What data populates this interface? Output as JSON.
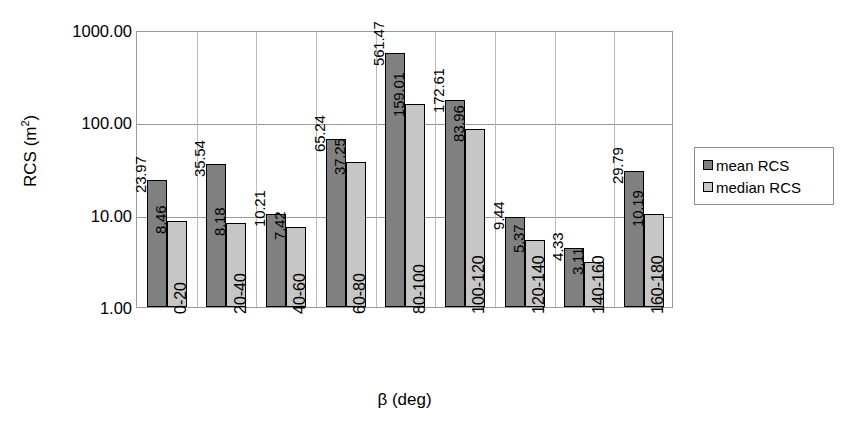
{
  "chart_data": {
    "type": "bar",
    "title": "",
    "xlabel": "β (deg)",
    "ylabel": "RCS (m²)",
    "ylabel_base": "RCS (m",
    "ylabel_sup": "2",
    "ylabel_close": ")",
    "yscale": "log",
    "ylim": [
      1,
      1000
    ],
    "ytick_labels": [
      "1000.00",
      "100.00",
      "10.00",
      "1.00"
    ],
    "ytick_values": [
      1000,
      100,
      10,
      1
    ],
    "grid": true,
    "legend_position": "right",
    "categories": [
      "0-20",
      "20-40",
      "40-60",
      "60-80",
      "80-100",
      "100-120",
      "120-140",
      "140-160",
      "160-180"
    ],
    "series": [
      {
        "name": "mean RCS",
        "color": "#808080",
        "values": [
          23.97,
          35.54,
          10.21,
          65.24,
          561.47,
          172.61,
          9.44,
          4.33,
          29.79
        ],
        "labels": [
          "23.97",
          "35.54",
          "10.21",
          "65.24",
          "561.47",
          "172.61",
          "9.44",
          "4.33",
          "29.79"
        ]
      },
      {
        "name": "median RCS",
        "color": "#c6c6c6",
        "values": [
          8.46,
          8.18,
          7.42,
          37.25,
          159.01,
          83.96,
          5.37,
          3.11,
          10.19
        ],
        "labels": [
          "8.46",
          "8.18",
          "7.42",
          "37.25",
          "159.01",
          "83.96",
          "5.37",
          "3.11",
          "10.19"
        ]
      }
    ]
  },
  "legend": {
    "items": [
      {
        "label": "mean RCS",
        "swatch": "mean"
      },
      {
        "label": "median RCS",
        "swatch": "median"
      }
    ]
  }
}
